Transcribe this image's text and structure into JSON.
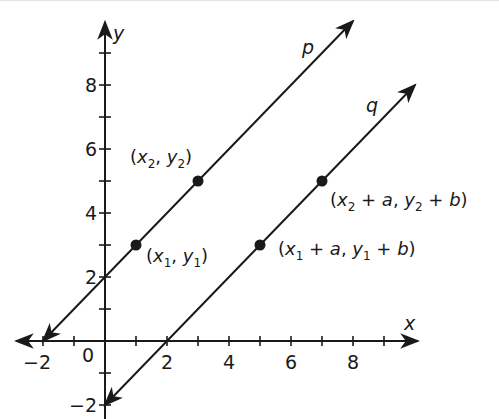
{
  "figure": {
    "type": "coordinate-plane",
    "origin_px": [
      105,
      341
    ],
    "unit_px": {
      "x": 31,
      "y": 32
    },
    "axes": {
      "x_label": "x",
      "y_label": "y",
      "origin_label": "0",
      "x_range": [
        -3,
        10
      ],
      "y_range": [
        -2,
        10
      ],
      "x_tick_labels": [
        "−2",
        "2",
        "4",
        "6",
        "8"
      ],
      "x_tick_values": [
        -2,
        2,
        4,
        6,
        8
      ],
      "y_tick_labels": [
        "8",
        "6",
        "4",
        "2",
        "−2"
      ],
      "y_tick_values": [
        8,
        6,
        4,
        2,
        -2
      ]
    },
    "lines": [
      {
        "name": "p",
        "label": "p",
        "equation": "y = x + 2",
        "from": [
          -2,
          0
        ],
        "to": [
          8,
          10
        ]
      },
      {
        "name": "q",
        "label": "q",
        "equation": "y = x − 2",
        "from": [
          0,
          -2
        ],
        "to": [
          10,
          8
        ]
      }
    ],
    "points": [
      {
        "id": "p1",
        "coords": [
          1,
          3
        ],
        "label_parts": [
          "(",
          "x",
          "1",
          ", ",
          "y",
          "1",
          ")"
        ]
      },
      {
        "id": "p2",
        "coords": [
          3,
          5
        ],
        "label_parts": [
          "(",
          "x",
          "2",
          ", ",
          "y",
          "2",
          ")"
        ]
      },
      {
        "id": "q1",
        "coords": [
          5,
          3
        ],
        "label_parts": [
          "(",
          "x",
          "1",
          " + ",
          "a",
          ", ",
          "y",
          "1",
          " + ",
          "b",
          ")"
        ]
      },
      {
        "id": "q2",
        "coords": [
          7,
          5
        ],
        "label_parts": [
          "(",
          "x",
          "2",
          " + ",
          "a",
          ", ",
          "y",
          "2",
          " + ",
          "b",
          ")"
        ]
      }
    ],
    "colors": {
      "ink": "#1a1a1a",
      "background": "#ffffff"
    }
  }
}
